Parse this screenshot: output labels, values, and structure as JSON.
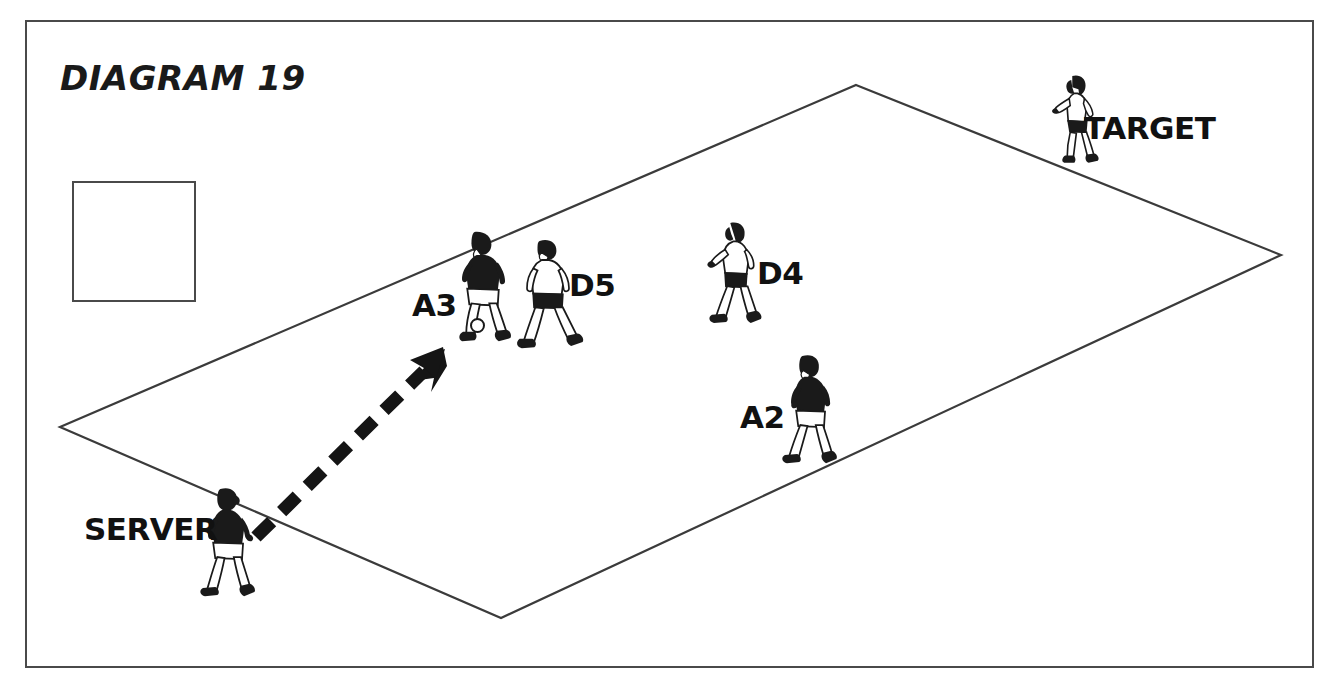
{
  "diagram": {
    "title": "DIAGRAM 19",
    "check_mark": "check-mark",
    "frame_color": "#4a4a4a",
    "ink_color": "#1a1a1a",
    "court_shape": "parallelogram",
    "court_corners": [
      [
        856,
        85
      ],
      [
        1281,
        255
      ],
      [
        501,
        618
      ],
      [
        60,
        427
      ]
    ]
  },
  "labels": {
    "target": "TARGET",
    "d5": "D5",
    "d4": "D4",
    "a3": "A3",
    "a2": "A2",
    "server": "SERVER"
  },
  "players": [
    {
      "id": "target",
      "label": "TARGET",
      "team": "defense",
      "jersey": "white",
      "shorts": "black",
      "x": 1058,
      "y": 74
    },
    {
      "id": "a3",
      "label": "A3",
      "team": "attack",
      "jersey": "black",
      "shorts": "white",
      "x": 462,
      "y": 232
    },
    {
      "id": "d5",
      "label": "D5",
      "team": "defense",
      "jersey": "white",
      "shorts": "black",
      "x": 527,
      "y": 239
    },
    {
      "id": "d4",
      "label": "D4",
      "team": "defense",
      "jersey": "white",
      "shorts": "black",
      "x": 716,
      "y": 222
    },
    {
      "id": "a2",
      "label": "A2",
      "team": "attack",
      "jersey": "black",
      "shorts": "white",
      "x": 790,
      "y": 355
    },
    {
      "id": "server",
      "label": "SERVER",
      "team": "attack",
      "jersey": "black",
      "shorts": "white",
      "x": 207,
      "y": 488
    }
  ],
  "ball": {
    "name": "ball",
    "x": 478,
    "y": 326
  },
  "arrow": {
    "name": "serve-pass-arrow",
    "style": "dashed",
    "from": [
      255,
      537
    ],
    "to": [
      443,
      352
    ]
  }
}
